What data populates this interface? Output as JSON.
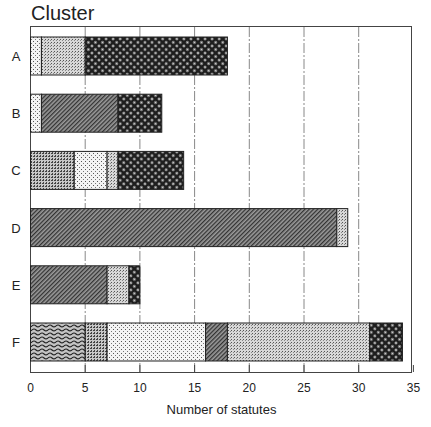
{
  "chart_data": {
    "type": "bar",
    "orientation": "horizontal",
    "stacked": true,
    "title": "Cluster",
    "xlabel": "Number of statutes",
    "ylabel": "Cluster",
    "categories": [
      "A",
      "B",
      "C",
      "D",
      "E",
      "F"
    ],
    "xlim": [
      0,
      35
    ],
    "xticks": [
      0,
      5,
      10,
      15,
      20,
      25,
      30,
      35
    ],
    "grid": "vertical dash-dot lines at 5-unit intervals",
    "legend": "none",
    "segments": {
      "A": [
        {
          "pattern": "sparse-dots",
          "start": 0,
          "end": 1
        },
        {
          "pattern": "fine-dots",
          "start": 1,
          "end": 5
        },
        {
          "pattern": "dark-crosshatch",
          "start": 5,
          "end": 18
        }
      ],
      "B": [
        {
          "pattern": "sparse-dots",
          "start": 0,
          "end": 1
        },
        {
          "pattern": "diagonal-hatch",
          "start": 1,
          "end": 8
        },
        {
          "pattern": "dark-crosshatch",
          "start": 8,
          "end": 12
        }
      ],
      "C": [
        {
          "pattern": "fine-grid",
          "start": 0,
          "end": 4
        },
        {
          "pattern": "sparse-dots",
          "start": 4,
          "end": 7
        },
        {
          "pattern": "fine-dots",
          "start": 7,
          "end": 8
        },
        {
          "pattern": "dark-crosshatch",
          "start": 8,
          "end": 14
        }
      ],
      "D": [
        {
          "pattern": "diagonal-hatch",
          "start": 0,
          "end": 28
        },
        {
          "pattern": "fine-dots",
          "start": 28,
          "end": 29
        }
      ],
      "E": [
        {
          "pattern": "diagonal-hatch",
          "start": 0,
          "end": 7
        },
        {
          "pattern": "fine-dots",
          "start": 7,
          "end": 9
        },
        {
          "pattern": "dark-crosshatch",
          "start": 9,
          "end": 10
        }
      ],
      "F": [
        {
          "pattern": "wavy",
          "start": 0,
          "end": 5
        },
        {
          "pattern": "fine-grid",
          "start": 5,
          "end": 7
        },
        {
          "pattern": "sparse-dots",
          "start": 7,
          "end": 16
        },
        {
          "pattern": "diagonal-hatch",
          "start": 16,
          "end": 18
        },
        {
          "pattern": "fine-dots",
          "start": 18,
          "end": 31
        },
        {
          "pattern": "dark-crosshatch",
          "start": 31,
          "end": 34
        }
      ]
    },
    "totals": {
      "A": 18,
      "B": 12,
      "C": 14,
      "D": 29,
      "E": 10,
      "F": 34
    }
  }
}
